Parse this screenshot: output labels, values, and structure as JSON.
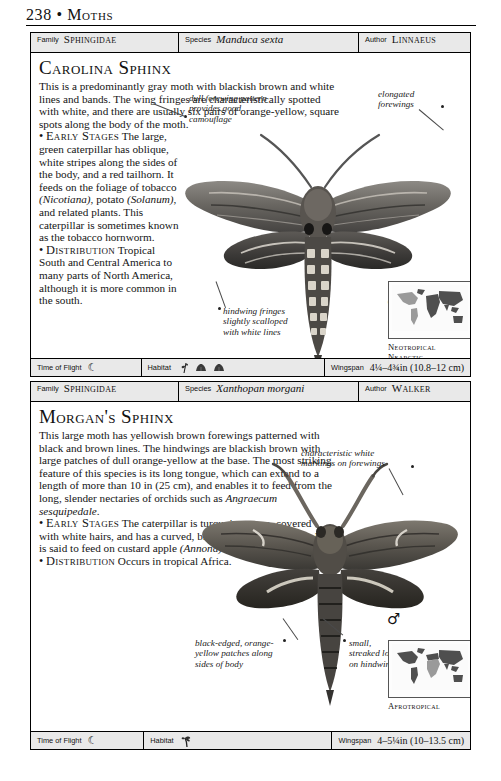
{
  "page": {
    "folio": "238",
    "separator": "•",
    "section": "Moths"
  },
  "entries": [
    {
      "id": "carolina-sphinx",
      "idbar": {
        "family_label": "Family",
        "family_value": "Sphingidae",
        "species_label": "Species",
        "species_value": "Manduca sexta",
        "author_label": "Author",
        "author_value": "Linnaeus"
      },
      "headline": "Carolina Sphinx",
      "intro": "This is a predominantly gray moth with blackish brown and white lines and bands. The wing fringes are characteristically spotted with white, and there are usually six pairs of orange-yellow, square spots along the body of the moth.",
      "early_bullet": "•",
      "early_label": "Early Stages",
      "early_text_1": "The large, green caterpillar has oblique, white stripes along the sides of the body, and a red tailhorn. It feeds on the foliage of tobacco ",
      "early_italic_1": "(Nicotiana)",
      "early_text_2": ", potato ",
      "early_italic_2": "(Solanum)",
      "early_text_3": ", and related plants. This caterpillar is sometimes known as the tobacco hornworm.",
      "dist_bullet": "•",
      "dist_label": "Distribution",
      "dist_text": "Tropical South and Central America to many parts of North America, although it is more common in the south.",
      "annotations": [
        "dull forewing pattern provides good camouflage",
        "elongated forewings",
        "hindwing fringes slightly scalloped with white lines"
      ],
      "sex_symbol": "♂",
      "map": {
        "regions": [
          "Neotropical",
          "Nearctic"
        ],
        "highlight_color": "#9a9a9a",
        "land_color": "#4f4f4f"
      },
      "footer": {
        "time_label": "Time of Flight",
        "time_glyph": "☾",
        "habitat_label": "Habitat",
        "habitat_glyphs": [
          "plant-sprig-icon",
          "shrub-icon",
          "shrub-icon"
        ],
        "wingspan_label": "Wingspan",
        "wingspan_value": "4¼–4¾in (10.8–12 cm)"
      }
    },
    {
      "id": "morgans-sphinx",
      "idbar": {
        "family_label": "Family",
        "family_value": "Sphingidae",
        "species_label": "Species",
        "species_value": "Xanthopan morgani",
        "author_label": "Author",
        "author_value": "Walker"
      },
      "headline": "Morgan's Sphinx",
      "intro_1": "This large moth has yellowish brown forewings patterned with black and brown lines. The hindwings are blackish brown with large patches of dull orange-yellow at the base. The most striking feature of this species is its long tongue, which can extend to a length of more than 10 in (25 cm), and enables it to feed from the long, slender nectaries of orchids such as ",
      "intro_italic": "Angraecum sesquipedale",
      "intro_2": ".",
      "early_bullet": "•",
      "early_label": "Early Stages",
      "early_text_1": "The caterpillar is turquoise-green, covered with white hairs, and has a curved, black and purple tailhorn. It is said to feed on custard apple ",
      "early_italic_1": "(Annona)",
      "early_text_2": " and ",
      "early_italic_2": "Uvaria",
      "early_text_3": ".",
      "dist_bullet": "•",
      "dist_label": "Distribution",
      "dist_text": "Occurs in tropical Africa.",
      "annotations": [
        "characteristic white markings on forewings",
        "black-edged, orange-yellow patches along sides of body",
        "small, streaked lobe on hindwings"
      ],
      "sex_symbol": "♂",
      "map": {
        "regions": [
          "Afrotropical"
        ],
        "highlight_color": "#9a9a9a",
        "land_color": "#4f4f4f"
      },
      "footer": {
        "time_label": "Time of Flight",
        "time_glyph": "☾",
        "habitat_label": "Habitat",
        "habitat_glyphs": [
          "palm-tree-icon"
        ],
        "wingspan_label": "Wingspan",
        "wingspan_value": "4–5¼in (10–13.5 cm)"
      }
    }
  ]
}
